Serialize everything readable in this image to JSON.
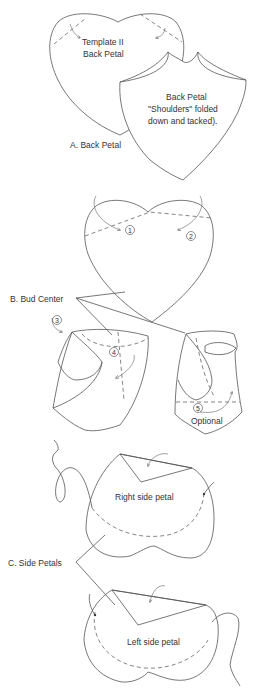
{
  "section_a": {
    "template_label_line1": "Template II",
    "template_label_line2": "Back Petal",
    "folded_label_line1": "Back Petal",
    "folded_label_line2": "\"Shoulders\" folded",
    "folded_label_line3": "down and tacked).",
    "caption": "A. Back Petal"
  },
  "section_b": {
    "caption": "B. Bud Center",
    "steps": [
      "1",
      "2",
      "3",
      "4",
      "5"
    ],
    "optional_label": "Optional"
  },
  "section_c": {
    "caption": "C. Side Petals",
    "right_label": "Right side petal",
    "left_label": "Left side petal"
  },
  "colors": {
    "line": "#555555",
    "text": "#333333",
    "background": "#ffffff"
  }
}
